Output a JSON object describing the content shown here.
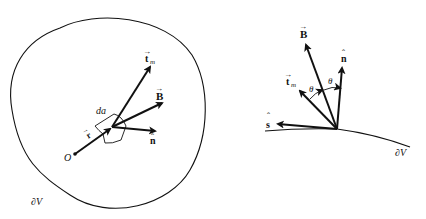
{
  "left_diagram": {
    "labels": {
      "tm": "t",
      "tm_sub": "m",
      "B": "B",
      "n": "n",
      "da": "da",
      "r": "r",
      "origin": "O",
      "boundary": "∂V"
    },
    "arrow_glyph": "→",
    "hat_glyph": "ˆ"
  },
  "right_diagram": {
    "labels": {
      "B": "B",
      "n": "n",
      "tm": "t",
      "tm_sub": "m",
      "s": "s",
      "theta1": "θ",
      "theta2": "θ",
      "boundary": "∂V"
    },
    "arrow_glyph": "→",
    "hat_glyph": "ˆ"
  },
  "colors": {
    "ink": "#111111",
    "background": "#ffffff"
  }
}
